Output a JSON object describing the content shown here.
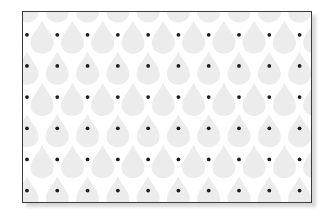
{
  "artwork": {
    "title": "Teardrop repeat pattern swatch",
    "description": "Seamless repeating water-drop motif in pale grey on white with small black apex dots, shown inside a thin dark rectangular frame with a soft drop shadow.",
    "motif_name": "teardrop",
    "accent_dot_name": "apex-dot"
  },
  "canvas": {
    "width": 333,
    "height": 220,
    "background_color": "#ffffff"
  },
  "frame": {
    "x": 22,
    "y": 11,
    "width": 290,
    "height": 192,
    "border_color": "#3b3b3b",
    "border_width": 1.4,
    "fill_color": "#ffffff",
    "shadow_color": "#b9b9b9",
    "shadow_offset_x": 4,
    "shadow_offset_y": 4
  },
  "pattern": {
    "motif_fill_color": "#ececec",
    "dot_color": "#1c1c1c",
    "dot_radius": 1.9,
    "columns": 10,
    "rows": 7,
    "column_spacing": 30.5,
    "row_spacing": 31.5,
    "row_offset_x": 15.25,
    "origin_x": 4,
    "origin_y": -8,
    "drop_width": 23,
    "drop_height": 30,
    "orientation": "point-up",
    "stagger": "half-drop-alternate-rows"
  },
  "dot_rows": [
    {
      "row": 1,
      "y": 23,
      "count": 10,
      "offset": false
    },
    {
      "row": 2,
      "y": 54.5,
      "count": 10,
      "offset": false
    },
    {
      "row": 3,
      "y": 86,
      "count": 10,
      "offset": false
    },
    {
      "row": 4,
      "y": 117.5,
      "count": 10,
      "offset": false
    },
    {
      "row": 5,
      "y": 149,
      "count": 10,
      "offset": false
    },
    {
      "row": 6,
      "y": 180.5,
      "count": 10,
      "offset": false
    }
  ]
}
